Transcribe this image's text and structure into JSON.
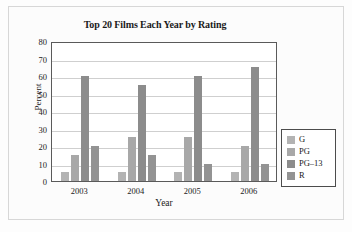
{
  "figure": {
    "title": "Top 20 Films Each Year by Rating"
  },
  "axes": {
    "xlabel": "Year",
    "ylabel": "Percent",
    "yticks": [
      "80",
      "70",
      "60",
      "50",
      "40",
      "30",
      "20",
      "10",
      "0"
    ],
    "xticks": [
      "2003",
      "2004",
      "2005",
      "2006"
    ]
  },
  "legend": {
    "items": [
      {
        "label": "G",
        "color": "#b3b3b3"
      },
      {
        "label": "PG",
        "color": "#a8a8a8"
      },
      {
        "label": "PG–13",
        "color": "#8c8c8c"
      },
      {
        "label": "R",
        "color": "#939393"
      }
    ]
  },
  "chart_data": {
    "type": "bar",
    "title": "Top 20 Films Each Year by Rating",
    "xlabel": "Year",
    "ylabel": "Percent",
    "categories": [
      "2003",
      "2004",
      "2005",
      "2006"
    ],
    "series": [
      {
        "name": "G",
        "color": "#b3b3b3",
        "values": [
          5,
          5,
          5,
          5
        ]
      },
      {
        "name": "PG",
        "color": "#a8a8a8",
        "values": [
          15,
          25,
          25,
          20
        ]
      },
      {
        "name": "PG–13",
        "color": "#8c8c8c",
        "values": [
          60,
          55,
          60,
          65
        ]
      },
      {
        "name": "R",
        "color": "#939393",
        "values": [
          20,
          15,
          10,
          10
        ]
      }
    ],
    "ylim": [
      0,
      80
    ],
    "ytick_step": 10,
    "grid": "horizontal",
    "legend_position": "right-outside"
  }
}
